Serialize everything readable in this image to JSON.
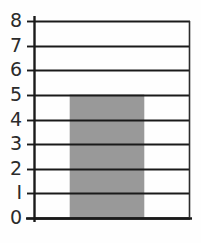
{
  "chart_data": {
    "type": "bar",
    "title": "",
    "subtitle": "",
    "xlabel": "",
    "ylabel": "",
    "categories": [
      ""
    ],
    "values": [
      5
    ],
    "series": [
      {
        "name": "",
        "values": [
          5
        ]
      }
    ],
    "ylim": [
      0,
      8
    ],
    "y_ticks": [
      0,
      1,
      2,
      3,
      4,
      5,
      6,
      7,
      8
    ],
    "y_tick_labels": [
      "0",
      "I",
      "2",
      "3",
      "4",
      "5",
      "6",
      "7",
      "8"
    ],
    "x_tick_labels": [],
    "grid": true,
    "grid_axis": "y",
    "legend": false,
    "legend_position": "none",
    "annotations": [],
    "bar_value": 5,
    "bar_color": "#999999",
    "bar_edge_color": "#999999",
    "grid_color": "#1a1a1a",
    "axis_color": "#1a1a1a",
    "background_color": "#fefefe",
    "text_color": "#2b2b2b"
  },
  "axis": {
    "y_axis_name": "value-axis",
    "x_axis_name": "category-axis"
  },
  "geometry": {
    "plot_left": 34,
    "plot_right": 190,
    "plot_top": 21,
    "plot_bottom": 218,
    "bar_left": 70,
    "bar_right": 144
  }
}
